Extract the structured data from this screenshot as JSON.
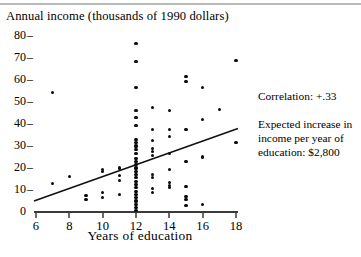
{
  "figure": {
    "title": "Annual income (thousands of 1990 dollars)",
    "xlabel": "Years of education",
    "notes": {
      "correlation": "Correlation:  +.33",
      "expected_increase": "Expected increase in income per year of education: $2,800"
    }
  },
  "chart_data": {
    "type": "scatter",
    "title": "Annual income (thousands of 1990 dollars)",
    "xlabel": "Years of education",
    "ylabel": "Annual income (thousands of 1990 dollars)",
    "xlim": [
      6,
      18
    ],
    "ylim": [
      0,
      82
    ],
    "xticks": [
      6,
      8,
      10,
      12,
      14,
      16,
      18
    ],
    "yticks": [
      0,
      10,
      20,
      30,
      40,
      50,
      60,
      70,
      80
    ],
    "grid": false,
    "legend": null,
    "correlation": 0.33,
    "expected_increase_per_year_dollars": 2800,
    "trend_line": {
      "type": "line",
      "points": [
        [
          6,
          5.0
        ],
        [
          18,
          38.0
        ]
      ],
      "slope": 2.75,
      "intercept": -11.5
    },
    "points": [
      [
        7,
        54.5
      ],
      [
        7,
        13.0
      ],
      [
        8,
        16.0
      ],
      [
        9,
        7.5
      ],
      [
        9,
        5.5
      ],
      [
        10,
        19.5
      ],
      [
        10,
        18.5
      ],
      [
        10,
        9.0
      ],
      [
        10,
        6.5
      ],
      [
        11,
        20.0
      ],
      [
        11,
        16.5
      ],
      [
        11,
        14.5
      ],
      [
        11,
        8.0
      ],
      [
        12,
        76.5
      ],
      [
        12,
        68.5
      ],
      [
        12,
        56.5
      ],
      [
        12,
        46.0
      ],
      [
        12,
        43.0
      ],
      [
        12,
        39.5
      ],
      [
        12,
        33.0
      ],
      [
        12,
        31.5
      ],
      [
        12,
        30.0
      ],
      [
        12,
        28.5
      ],
      [
        12,
        26.5
      ],
      [
        12,
        24.5
      ],
      [
        12,
        23.0
      ],
      [
        12,
        21.5
      ],
      [
        12,
        20.0
      ],
      [
        12,
        18.5
      ],
      [
        12,
        17.0
      ],
      [
        12,
        15.5
      ],
      [
        12,
        14.0
      ],
      [
        12,
        12.5
      ],
      [
        12,
        11.0
      ],
      [
        12,
        9.5
      ],
      [
        12,
        8.0
      ],
      [
        12,
        6.5
      ],
      [
        12,
        5.0
      ],
      [
        12,
        3.5
      ],
      [
        12,
        2.0
      ],
      [
        12,
        0.8
      ],
      [
        13,
        47.5
      ],
      [
        13,
        37.5
      ],
      [
        13,
        32.5
      ],
      [
        13,
        29.0
      ],
      [
        13,
        27.5
      ],
      [
        13,
        25.5
      ],
      [
        13,
        17.0
      ],
      [
        13,
        15.5
      ],
      [
        13,
        10.5
      ],
      [
        13,
        9.0
      ],
      [
        14,
        46.0
      ],
      [
        14,
        37.5
      ],
      [
        14,
        34.5
      ],
      [
        14,
        26.5
      ],
      [
        14,
        19.5
      ],
      [
        14,
        13.5
      ],
      [
        14,
        12.0
      ],
      [
        14,
        11.0
      ],
      [
        15,
        61.5
      ],
      [
        15,
        59.5
      ],
      [
        15,
        37.5
      ],
      [
        15,
        23.0
      ],
      [
        15,
        11.5
      ],
      [
        15,
        7.0
      ],
      [
        15,
        5.5
      ],
      [
        15,
        3.0
      ],
      [
        16,
        56.5
      ],
      [
        16,
        42.0
      ],
      [
        16,
        25.0
      ],
      [
        16,
        3.5
      ],
      [
        17,
        46.5
      ],
      [
        18,
        69.0
      ],
      [
        18,
        31.5
      ]
    ]
  }
}
